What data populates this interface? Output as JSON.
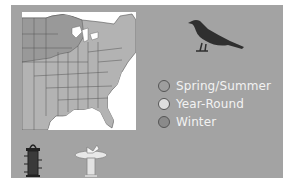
{
  "colors": {
    "panel": "#a3a3a3",
    "map_background": "#ffffff",
    "map_range": "#b3b3b3",
    "map_range_dark": "#8f8f8f",
    "bird": "#2f2f2f",
    "legend_text": "#f2f2f2"
  },
  "map": {
    "label": "Range map of eastern United States"
  },
  "bird": {
    "label": "Bird silhouette"
  },
  "legend": {
    "items": [
      {
        "label": "Spring/Summer",
        "color": "#9e9e9e"
      },
      {
        "label": "Year-Round",
        "color": "#dedede"
      },
      {
        "label": "Winter",
        "color": "#8a8a8a"
      }
    ]
  },
  "icons": {
    "feeder": "bird-feeder-icon",
    "bath": "bird-bath-icon"
  }
}
